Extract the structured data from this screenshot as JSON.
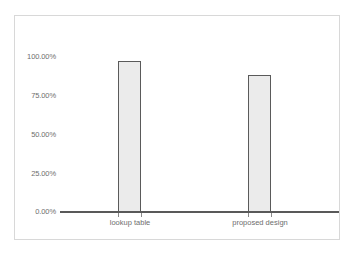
{
  "chart_data": {
    "type": "bar",
    "title": "",
    "subtitle": "",
    "xlabel": "",
    "ylabel": "",
    "categories": [
      "lookup table",
      "proposed design"
    ],
    "values": [
      97.0,
      88.0
    ],
    "series": [
      {
        "name": "accuracy",
        "values": [
          97.0,
          88.0
        ]
      }
    ],
    "ylim": [
      0,
      100
    ],
    "ytick_values": [
      0,
      25,
      50,
      75,
      100
    ],
    "ytick_labels": [
      "0.00%",
      "25.00%",
      "50.00%",
      "75.00%",
      "100.00%"
    ],
    "grid": false,
    "legend": false,
    "legend_position": "none",
    "bar_fill_color": "#ebebeb",
    "bar_border_color": "#5a5a5a",
    "axis_color": "#595959",
    "tick_label_color": "#6e6e6e",
    "frame_color": "#d8d8d8",
    "background_color": "#ffffff"
  }
}
